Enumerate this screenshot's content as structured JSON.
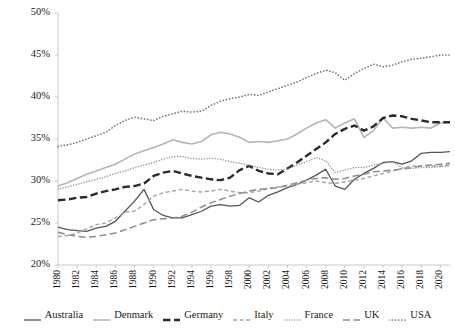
{
  "chart_data": {
    "type": "line",
    "title": "",
    "xlabel": "",
    "ylabel": "",
    "xlim": [
      1980,
      2021
    ],
    "ylim": [
      20,
      50
    ],
    "ytick_labels": [
      "50%",
      "45%",
      "40%",
      "35%",
      "30%",
      "25%",
      "20%"
    ],
    "ytick_values": [
      50,
      45,
      40,
      35,
      30,
      25,
      20
    ],
    "ytick_format": "percent",
    "grid": false,
    "legend_position": "bottom",
    "xtick_labels": [
      "1980",
      "1982",
      "1984",
      "1986",
      "1988",
      "1990",
      "1992",
      "1994",
      "1996",
      "1998",
      "2000",
      "2002",
      "2004",
      "2006",
      "2008",
      "2010",
      "2012",
      "2014",
      "2016",
      "2018",
      "2020"
    ],
    "xtick_values": [
      1980,
      1982,
      1984,
      1986,
      1988,
      1990,
      1992,
      1994,
      1996,
      1998,
      2000,
      2002,
      2004,
      2006,
      2008,
      2010,
      2012,
      2014,
      2016,
      2018,
      2020
    ],
    "x": [
      1980,
      1981,
      1982,
      1983,
      1984,
      1985,
      1986,
      1987,
      1988,
      1989,
      1990,
      1991,
      1992,
      1993,
      1994,
      1995,
      1996,
      1997,
      1998,
      1999,
      2000,
      2001,
      2002,
      2003,
      2004,
      2005,
      2006,
      2007,
      2008,
      2009,
      2010,
      2011,
      2012,
      2013,
      2014,
      2015,
      2016,
      2017,
      2018,
      2019,
      2020,
      2021
    ],
    "series": [
      {
        "name": "Australia",
        "color": "#555555",
        "style": "solid",
        "width": 1.3,
        "values": [
          24.5,
          24.2,
          24.1,
          24.0,
          24.4,
          24.6,
          25.2,
          26.4,
          27.6,
          29.0,
          26.6,
          25.9,
          25.6,
          25.6,
          26.0,
          26.4,
          27.0,
          27.2,
          27.0,
          27.1,
          28.0,
          27.5,
          28.3,
          28.7,
          29.2,
          29.6,
          30.1,
          30.7,
          31.4,
          29.4,
          29.0,
          30.2,
          30.9,
          31.5,
          32.2,
          32.3,
          32.0,
          32.4,
          33.3,
          33.4,
          33.4,
          33.5
        ]
      },
      {
        "name": "Denmark",
        "color": "#b5b5b5",
        "style": "solid",
        "width": 1.6,
        "values": [
          29.4,
          29.8,
          30.3,
          30.8,
          31.2,
          31.6,
          32.0,
          32.6,
          33.2,
          33.6,
          34.0,
          34.4,
          34.9,
          34.6,
          34.4,
          34.7,
          35.5,
          35.8,
          35.6,
          35.2,
          34.6,
          34.7,
          34.6,
          34.8,
          35.0,
          35.6,
          36.3,
          36.9,
          37.3,
          36.3,
          36.9,
          37.4,
          35.2,
          36.0,
          37.5,
          36.3,
          36.4,
          36.3,
          36.4,
          36.3,
          36.9,
          37.0
        ]
      },
      {
        "name": "Germany",
        "color": "#2b2b2b",
        "style": "dash-bold",
        "width": 2.4,
        "values": [
          27.7,
          27.8,
          28.0,
          28.1,
          28.5,
          28.8,
          29.0,
          29.3,
          29.4,
          29.7,
          30.6,
          31.0,
          31.2,
          30.9,
          30.6,
          30.4,
          30.2,
          30.1,
          30.4,
          31.3,
          31.8,
          31.2,
          30.9,
          30.8,
          31.5,
          32.2,
          33.0,
          33.8,
          34.6,
          35.6,
          36.2,
          36.6,
          36.0,
          36.5,
          37.5,
          37.8,
          37.7,
          37.4,
          37.2,
          37.0,
          37.0,
          37.0
        ]
      },
      {
        "name": "Italy",
        "color": "#a8a8a8",
        "style": "dash",
        "width": 1.5,
        "values": [
          23.4,
          23.5,
          23.8,
          24.3,
          24.8,
          25.0,
          25.6,
          26.3,
          26.4,
          27.2,
          28.2,
          28.6,
          28.8,
          29.0,
          28.8,
          28.7,
          28.8,
          29.0,
          28.8,
          28.6,
          28.6,
          28.8,
          29.1,
          29.3,
          29.4,
          29.6,
          29.8,
          30.0,
          29.8,
          29.7,
          29.9,
          30.1,
          30.3,
          30.6,
          30.9,
          31.2,
          31.5,
          31.8,
          31.8,
          31.8,
          31.8,
          31.9
        ]
      },
      {
        "name": "France",
        "color": "#9a9a9a",
        "style": "dotted-fine",
        "width": 1.5,
        "values": [
          29.0,
          29.3,
          29.6,
          29.9,
          30.2,
          30.5,
          30.9,
          31.2,
          31.6,
          31.9,
          32.2,
          32.6,
          32.9,
          32.9,
          32.7,
          32.6,
          32.7,
          32.6,
          32.3,
          32.1,
          31.9,
          31.6,
          31.4,
          31.3,
          31.4,
          31.9,
          32.3,
          32.8,
          32.4,
          31.0,
          31.3,
          31.6,
          31.6,
          31.9,
          32.1,
          32.3,
          31.6,
          31.5,
          31.6,
          31.6,
          31.7,
          31.8
        ]
      },
      {
        "name": "UK",
        "color": "#8d8d8d",
        "style": "dash-long",
        "width": 1.5,
        "values": [
          23.9,
          23.6,
          23.4,
          23.3,
          23.4,
          23.6,
          23.8,
          24.2,
          24.6,
          25.0,
          25.4,
          25.5,
          25.6,
          25.8,
          26.3,
          26.9,
          27.4,
          27.8,
          28.2,
          28.5,
          28.8,
          29.0,
          29.1,
          29.2,
          29.5,
          29.8,
          30.1,
          30.3,
          30.4,
          30.2,
          30.3,
          30.6,
          30.8,
          31.1,
          31.2,
          31.3,
          31.4,
          31.6,
          31.8,
          31.9,
          32.0,
          32.1
        ]
      },
      {
        "name": "USA",
        "color": "#777777",
        "style": "dotted",
        "width": 1.6,
        "values": [
          34.1,
          34.3,
          34.6,
          35.0,
          35.4,
          35.8,
          36.6,
          37.2,
          37.6,
          37.4,
          37.2,
          37.7,
          38.0,
          38.3,
          38.2,
          38.3,
          39.0,
          39.5,
          39.8,
          40.0,
          40.3,
          40.2,
          40.6,
          41.0,
          41.4,
          41.8,
          42.3,
          42.8,
          43.2,
          42.9,
          42.0,
          42.8,
          43.4,
          43.9,
          43.6,
          43.8,
          44.2,
          44.5,
          44.6,
          44.8,
          45.0,
          45.0
        ]
      }
    ]
  },
  "legend": {
    "items": [
      {
        "label": "Australia"
      },
      {
        "label": "Denmark"
      },
      {
        "label": "Germany"
      },
      {
        "label": "Italy"
      },
      {
        "label": "France"
      },
      {
        "label": "UK"
      },
      {
        "label": "USA"
      }
    ]
  }
}
